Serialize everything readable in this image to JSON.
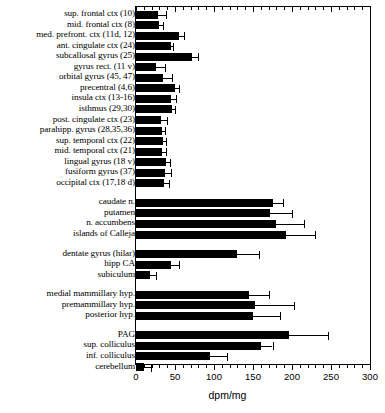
{
  "chart_data": {
    "type": "bar",
    "orientation": "horizontal",
    "title": "",
    "xlabel": "dpm/mg",
    "ylabel": "",
    "xlim": [
      0,
      300
    ],
    "xticks": [
      0,
      50,
      100,
      150,
      200,
      250,
      300
    ],
    "xtick_labels": [
      "0",
      "50",
      "100",
      "150",
      "200",
      "250",
      "300"
    ],
    "minor_tick_interval": 10,
    "grid": false,
    "legend": null,
    "error_bars": "one-sided (upper) SEM",
    "categories": [
      "sup. frontal ctx (10)",
      "mid. frontal ctx (8)",
      "med. prefront. ctx (11d, 12)",
      "ant. cingulate ctx (24)",
      "subcallosal gyrus (25)",
      "gyrus rect. (11 v)",
      "orbital gyrus (45, 47)",
      "precentral (4,6)",
      "insula ctx (13-16)",
      "isthmus (29,30)",
      "post. cingulate ctx  (23)",
      "parahipp. gyrus (28,35,36)",
      "sup. temporal ctx (22)",
      "mid. temporal ctx (21)",
      "lingual  gyrus (18 v)",
      "fusiform gyrus (37)",
      "occipital ctx  (17,18 d)",
      "caudate n.",
      "putamen",
      "n. accumbens",
      "islands of Calleja",
      "dentate gyrus (hilar)",
      "hipp CA",
      "subiculum",
      "medial mammillary hyp.",
      "premammillary hyp.",
      "posterior hyp.",
      "PAG",
      "sup. colliculus",
      "inf. colliculus",
      "cerebellum"
    ],
    "values": [
      28,
      30,
      55,
      45,
      72,
      26,
      34,
      50,
      45,
      46,
      32,
      33,
      35,
      33,
      39,
      37,
      36,
      175,
      172,
      180,
      192,
      130,
      45,
      18,
      145,
      152,
      150,
      196,
      160,
      95,
      10
    ],
    "errors": [
      10,
      5,
      7,
      3,
      8,
      11,
      12,
      5,
      6,
      4,
      8,
      4,
      4,
      5,
      4,
      8,
      6,
      14,
      28,
      35,
      38,
      28,
      10,
      8,
      25,
      50,
      35,
      50,
      15,
      22,
      9
    ],
    "group_breaks_after": [
      16,
      20,
      23,
      26
    ]
  }
}
